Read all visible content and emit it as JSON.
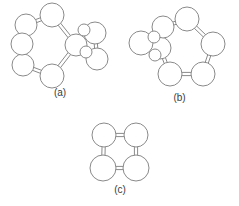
{
  "figure": {
    "width": 239,
    "height": 206,
    "background_color": "#ffffff",
    "line_color": "#8a8a8a",
    "label_color": "#3a3a3a",
    "caption_a": "(a)",
    "caption_b": "(b)",
    "caption_c": "(c)"
  },
  "chart_data": {
    "type": "diagram",
    "title": "",
    "panels": [
      {
        "id": "a",
        "label": "(a)",
        "description": "Seven-membered ring fused to a four-membered ring on the right side.",
        "atom_count": 10,
        "bond_count": 11,
        "atoms": [
          {
            "id": "a1",
            "cx": 26,
            "cy": 25,
            "r": 11
          },
          {
            "id": "a2",
            "cx": 52,
            "cy": 15,
            "r": 12
          },
          {
            "id": "a3",
            "cx": 76,
            "cy": 45,
            "r": 11
          },
          {
            "id": "a4",
            "cx": 52,
            "cy": 76,
            "r": 12
          },
          {
            "id": "a5",
            "cx": 23,
            "cy": 65,
            "r": 11
          },
          {
            "id": "a6",
            "cx": 22,
            "cy": 44,
            "r": 11
          },
          {
            "id": "a7",
            "cx": 95,
            "cy": 33,
            "r": 11
          },
          {
            "id": "a8",
            "cx": 97,
            "cy": 59,
            "r": 11
          },
          {
            "id": "a9",
            "cx": 84,
            "cy": 30,
            "r": 6
          },
          {
            "id": "a10",
            "cx": 86,
            "cy": 52,
            "r": 6
          }
        ],
        "bonds": [
          {
            "from": "a1",
            "to": "a2",
            "order": 2
          },
          {
            "from": "a2",
            "to": "a3",
            "order": 2
          },
          {
            "from": "a3",
            "to": "a4",
            "order": 2
          },
          {
            "from": "a4",
            "to": "a5",
            "order": 2
          },
          {
            "from": "a5",
            "to": "a6",
            "order": 2
          },
          {
            "from": "a6",
            "to": "a1",
            "order": 1
          },
          {
            "from": "a3",
            "to": "a9",
            "order": 1
          },
          {
            "from": "a3",
            "to": "a10",
            "order": 1
          },
          {
            "from": "a9",
            "to": "a7",
            "order": 1
          },
          {
            "from": "a10",
            "to": "a8",
            "order": 1
          },
          {
            "from": "a7",
            "to": "a8",
            "order": 2
          }
        ]
      },
      {
        "id": "b",
        "label": "(b)",
        "description": "Six-membered ring fused to a small bicyclic cluster on the left side.",
        "atom_count": 9,
        "bond_count": 10,
        "atoms": [
          {
            "id": "b1",
            "cx": 187,
            "cy": 19,
            "r": 12
          },
          {
            "id": "b2",
            "cx": 213,
            "cy": 44,
            "r": 12
          },
          {
            "id": "b3",
            "cx": 203,
            "cy": 74,
            "r": 12
          },
          {
            "id": "b4",
            "cx": 170,
            "cy": 74,
            "r": 12
          },
          {
            "id": "b5",
            "cx": 160,
            "cy": 48,
            "r": 11
          },
          {
            "id": "b6",
            "cx": 163,
            "cy": 27,
            "r": 11
          },
          {
            "id": "b7",
            "cx": 141,
            "cy": 43,
            "r": 12
          },
          {
            "id": "b8",
            "cx": 154,
            "cy": 37,
            "r": 6
          },
          {
            "id": "b9",
            "cx": 155,
            "cy": 55,
            "r": 6
          }
        ],
        "bonds": [
          {
            "from": "b1",
            "to": "b2",
            "order": 2
          },
          {
            "from": "b2",
            "to": "b3",
            "order": 2
          },
          {
            "from": "b3",
            "to": "b4",
            "order": 2
          },
          {
            "from": "b4",
            "to": "b5",
            "order": 2
          },
          {
            "from": "b5",
            "to": "b6",
            "order": 2
          },
          {
            "from": "b6",
            "to": "b1",
            "order": 2
          },
          {
            "from": "b6",
            "to": "b8",
            "order": 1
          },
          {
            "from": "b5",
            "to": "b9",
            "order": 1
          },
          {
            "from": "b8",
            "to": "b7",
            "order": 1
          },
          {
            "from": "b9",
            "to": "b7",
            "order": 1
          }
        ]
      },
      {
        "id": "c",
        "label": "(c)",
        "description": "Four-membered square ring with double bonds on all four edges.",
        "atom_count": 4,
        "bond_count": 4,
        "atoms": [
          {
            "id": "c1",
            "cx": 104,
            "cy": 135,
            "r": 12
          },
          {
            "id": "c2",
            "cx": 136,
            "cy": 135,
            "r": 12
          },
          {
            "id": "c3",
            "cx": 136,
            "cy": 168,
            "r": 13
          },
          {
            "id": "c4",
            "cx": 103,
            "cy": 168,
            "r": 13
          }
        ],
        "bonds": [
          {
            "from": "c1",
            "to": "c2",
            "order": 2
          },
          {
            "from": "c2",
            "to": "c3",
            "order": 2
          },
          {
            "from": "c3",
            "to": "c4",
            "order": 2
          },
          {
            "from": "c4",
            "to": "c1",
            "order": 2
          }
        ]
      }
    ]
  }
}
